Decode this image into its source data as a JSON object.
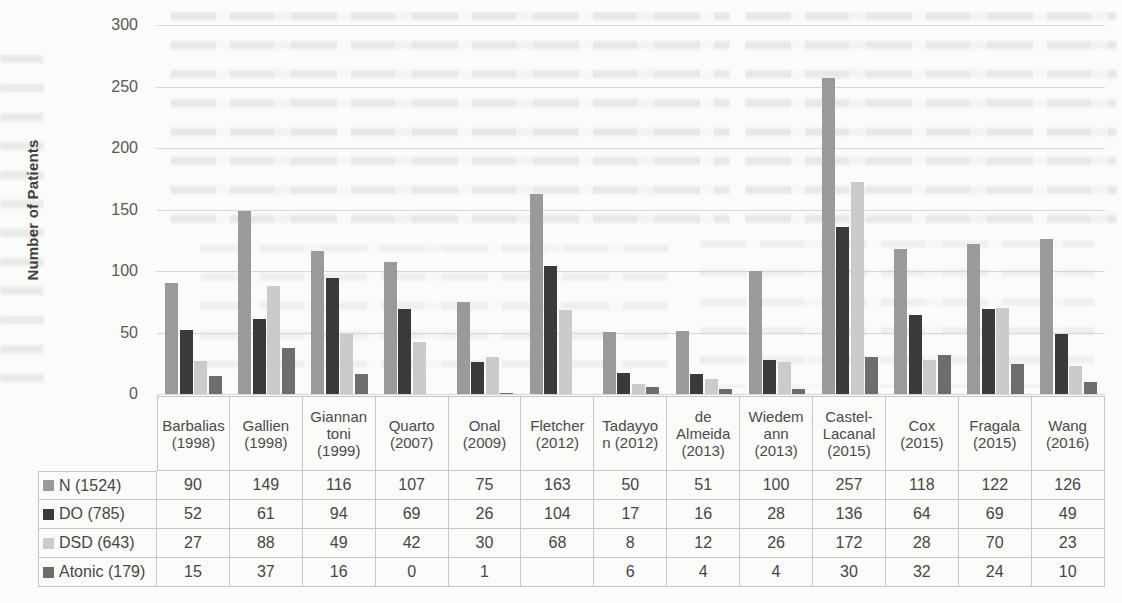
{
  "chart_data": {
    "type": "bar",
    "title": "",
    "xlabel": "",
    "ylabel": "Number of Patients",
    "ylim": [
      0,
      300
    ],
    "yticks": [
      300,
      250,
      200,
      150,
      100,
      50,
      0
    ],
    "grid": true,
    "legend_position": "table-row-headers",
    "categories": [
      "Barbalias (1998)",
      "Gallien (1998)",
      "Giannantoni (1999)",
      "Quarto (2007)",
      "Onal (2009)",
      "Fletcher (2012)",
      "Tadayyon (2012)",
      "de Almeida (2013)",
      "Wiedemann (2013)",
      "Castel-Lacanal (2015)",
      "Cox (2015)",
      "Fragala (2015)",
      "Wang (2016)"
    ],
    "category_label_lines": [
      [
        "Barbalias",
        "(1998)"
      ],
      [
        "Gallien",
        "(1998)"
      ],
      [
        "Giannan",
        "toni",
        "(1999)"
      ],
      [
        "Quarto",
        "(2007)"
      ],
      [
        "Onal",
        "(2009)"
      ],
      [
        "Fletcher",
        "(2012)"
      ],
      [
        "Tadayyo",
        "n (2012)"
      ],
      [
        "de",
        "Almeida",
        "(2013)"
      ],
      [
        "Wiedem",
        "ann",
        "(2013)"
      ],
      [
        "Castel-",
        "Lacanal",
        "(2015)"
      ],
      [
        "Cox",
        "(2015)"
      ],
      [
        "Fragala",
        "(2015)"
      ],
      [
        "Wang",
        "(2016)"
      ]
    ],
    "series": [
      {
        "name": "N (1524)",
        "color": "#9a9a9a",
        "values": [
          90,
          149,
          116,
          107,
          75,
          163,
          50,
          51,
          100,
          257,
          118,
          122,
          126
        ]
      },
      {
        "name": "DO (785)",
        "color": "#3a3a3a",
        "values": [
          52,
          61,
          94,
          69,
          26,
          104,
          17,
          16,
          28,
          136,
          64,
          69,
          49
        ]
      },
      {
        "name": "DSD (643)",
        "color": "#cbcbcb",
        "values": [
          27,
          88,
          49,
          42,
          30,
          68,
          8,
          12,
          26,
          172,
          28,
          70,
          23
        ]
      },
      {
        "name": "Atonic (179)",
        "color": "#6d6d6d",
        "values": [
          15,
          37,
          16,
          0,
          1,
          null,
          6,
          4,
          4,
          30,
          32,
          24,
          10
        ]
      }
    ],
    "colors": {
      "gridline": "#d6d6d3",
      "axis_text": "#585858",
      "table_border": "#c6c6c3",
      "table_text": "#464646",
      "page_background": "#fbfbf9"
    }
  }
}
